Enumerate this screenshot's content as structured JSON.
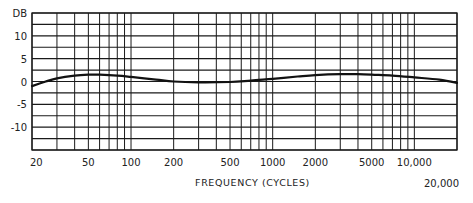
{
  "chart_data": {
    "type": "line",
    "title": "",
    "xlabel": "FREQUENCY (CYCLES)",
    "ylabel": "DB",
    "x_scale": "log",
    "xlim": [
      20,
      20000
    ],
    "ylim": [
      -15,
      15
    ],
    "grid": true,
    "legend": null,
    "y_ticks": [
      {
        "value": 15,
        "label": "DB"
      },
      {
        "value": 10,
        "label": "10"
      },
      {
        "value": 5,
        "label": "5"
      },
      {
        "value": 0,
        "label": "0"
      },
      {
        "value": -5,
        "label": "-5"
      },
      {
        "value": -10,
        "label": "-10"
      }
    ],
    "y_gridlines": [
      15,
      12.5,
      10,
      7.5,
      5,
      2.5,
      0,
      -2.5,
      -5,
      -7.5,
      -10,
      -12.5,
      -15
    ],
    "x_ticks": [
      {
        "value": 20,
        "label": "20"
      },
      {
        "value": 50,
        "label": "50"
      },
      {
        "value": 100,
        "label": "100"
      },
      {
        "value": 200,
        "label": "200"
      },
      {
        "value": 500,
        "label": "500"
      },
      {
        "value": 1000,
        "label": "1000"
      },
      {
        "value": 2000,
        "label": "2000"
      },
      {
        "value": 5000,
        "label": "5000"
      },
      {
        "value": 10000,
        "label": "10,000"
      },
      {
        "value": 20000,
        "label": "20,000"
      }
    ],
    "x_gridlines": [
      20,
      30,
      40,
      50,
      60,
      70,
      80,
      90,
      100,
      200,
      300,
      400,
      500,
      600,
      700,
      800,
      900,
      1000,
      2000,
      3000,
      4000,
      5000,
      6000,
      7000,
      8000,
      9000,
      10000,
      20000
    ],
    "series": [
      {
        "name": "Frequency response",
        "x": [
          20,
          25,
          30,
          40,
          50,
          60,
          80,
          100,
          150,
          200,
          300,
          500,
          700,
          1000,
          1500,
          2000,
          3000,
          4000,
          5000,
          7000,
          10000,
          15000,
          20000
        ],
        "y": [
          -1.0,
          0.0,
          0.7,
          1.3,
          1.5,
          1.5,
          1.3,
          1.0,
          0.4,
          0.0,
          -0.2,
          -0.1,
          0.2,
          0.6,
          1.1,
          1.4,
          1.6,
          1.6,
          1.5,
          1.3,
          0.9,
          0.4,
          -0.3
        ]
      }
    ]
  }
}
